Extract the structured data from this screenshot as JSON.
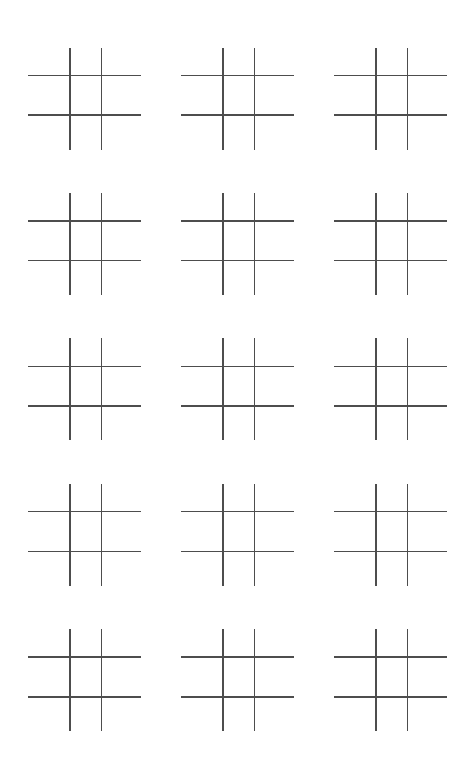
{
  "page": {
    "background_color": "#ffffff",
    "width": 475,
    "height": 771,
    "visible_text": ""
  },
  "worksheet": {
    "kind": "tic-tac-toe-grid-sheet",
    "columns": 3,
    "rows": 5,
    "board_count": 15,
    "line_color": "#4d4d4d",
    "line_thickness_px": 1.5,
    "board_width_px": 113,
    "board_height_px": 102,
    "lines_per_board": {
      "vertical": 2,
      "horizontal": 2
    },
    "cells_per_board": 9,
    "boards": [
      {
        "id": "board-1",
        "row": 1,
        "col": 1,
        "marks": [
          "",
          "",
          "",
          "",
          "",
          "",
          "",
          "",
          ""
        ]
      },
      {
        "id": "board-2",
        "row": 1,
        "col": 2,
        "marks": [
          "",
          "",
          "",
          "",
          "",
          "",
          "",
          "",
          ""
        ]
      },
      {
        "id": "board-3",
        "row": 1,
        "col": 3,
        "marks": [
          "",
          "",
          "",
          "",
          "",
          "",
          "",
          "",
          ""
        ]
      },
      {
        "id": "board-4",
        "row": 2,
        "col": 1,
        "marks": [
          "",
          "",
          "",
          "",
          "",
          "",
          "",
          "",
          ""
        ]
      },
      {
        "id": "board-5",
        "row": 2,
        "col": 2,
        "marks": [
          "",
          "",
          "",
          "",
          "",
          "",
          "",
          "",
          ""
        ]
      },
      {
        "id": "board-6",
        "row": 2,
        "col": 3,
        "marks": [
          "",
          "",
          "",
          "",
          "",
          "",
          "",
          "",
          ""
        ]
      },
      {
        "id": "board-7",
        "row": 3,
        "col": 1,
        "marks": [
          "",
          "",
          "",
          "",
          "",
          "",
          "",
          "",
          ""
        ]
      },
      {
        "id": "board-8",
        "row": 3,
        "col": 2,
        "marks": [
          "",
          "",
          "",
          "",
          "",
          "",
          "",
          "",
          ""
        ]
      },
      {
        "id": "board-9",
        "row": 3,
        "col": 3,
        "marks": [
          "",
          "",
          "",
          "",
          "",
          "",
          "",
          "",
          ""
        ]
      },
      {
        "id": "board-10",
        "row": 4,
        "col": 1,
        "marks": [
          "",
          "",
          "",
          "",
          "",
          "",
          "",
          "",
          ""
        ]
      },
      {
        "id": "board-11",
        "row": 4,
        "col": 2,
        "marks": [
          "",
          "",
          "",
          "",
          "",
          "",
          "",
          "",
          ""
        ]
      },
      {
        "id": "board-12",
        "row": 4,
        "col": 3,
        "marks": [
          "",
          "",
          "",
          "",
          "",
          "",
          "",
          "",
          ""
        ]
      },
      {
        "id": "board-13",
        "row": 5,
        "col": 1,
        "marks": [
          "",
          "",
          "",
          "",
          "",
          "",
          "",
          "",
          ""
        ]
      },
      {
        "id": "board-14",
        "row": 5,
        "col": 2,
        "marks": [
          "",
          "",
          "",
          "",
          "",
          "",
          "",
          "",
          ""
        ]
      },
      {
        "id": "board-15",
        "row": 5,
        "col": 3,
        "marks": [
          "",
          "",
          "",
          "",
          "",
          "",
          "",
          "",
          ""
        ]
      }
    ]
  }
}
